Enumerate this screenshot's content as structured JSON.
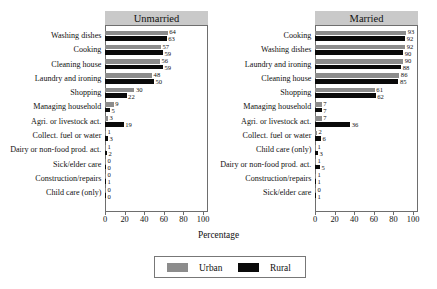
{
  "chart_data": {
    "type": "bar",
    "title": "",
    "xlabel": "Percentage",
    "ylabel": "",
    "xlim": [
      0,
      105
    ],
    "xticks": [
      0,
      20,
      40,
      60,
      80,
      100
    ],
    "grid": false,
    "orientation": "horizontal",
    "legend_position": "bottom-center",
    "legend": [
      {
        "name": "Urban",
        "color": "#8c8c8c"
      },
      {
        "name": "Rural",
        "color": "#0a0a0a"
      }
    ],
    "panels": [
      {
        "title": "Unmarried",
        "categories": [
          "Washing dishes",
          "Cooking",
          "Cleaning house",
          "Laundry and ironing",
          "Shopping",
          "Managing household",
          "Agri. or livestock act.",
          "Collect. fuel or water",
          "Dairy or non-food prod. act.",
          "Sick/elder care",
          "Construction/repairs",
          "Child care (only)"
        ],
        "series": [
          {
            "name": "Urban",
            "values": [
              64,
              57,
              56,
              48,
              30,
              9,
              3,
              1,
              1,
              0,
              0,
              0
            ]
          },
          {
            "name": "Rural",
            "values": [
              63,
              59,
              59,
              50,
              22,
              5,
              19,
              3,
              2,
              0,
              1,
              0
            ]
          }
        ]
      },
      {
        "title": "Married",
        "categories": [
          "Cooking",
          "Washing dishes",
          "Laundry and ironing",
          "Cleaning house",
          "Shopping",
          "Managing household",
          "Agri. or livestock act.",
          "Collect. fuel or water",
          "Child care (only)",
          "Dairy or non-food prod. act.",
          "Construction/repairs",
          "Sick/elder care"
        ],
        "series": [
          {
            "name": "Urban",
            "values": [
              93,
              92,
              90,
              86,
              61,
              7,
              7,
              2,
              1,
              1,
              1,
              0
            ]
          },
          {
            "name": "Rural",
            "values": [
              92,
              90,
              88,
              85,
              62,
              7,
              36,
              6,
              3,
              5,
              1,
              1
            ]
          }
        ]
      }
    ]
  },
  "axis": {
    "xlabel": "Percentage"
  },
  "legend": {
    "urban_label": "Urban",
    "rural_label": "Rural"
  },
  "colors": {
    "urban": "#8c8c8c",
    "rural": "#0a0a0a",
    "panel_strip": "#c9c9c9",
    "frame": "#6e6e6e"
  }
}
